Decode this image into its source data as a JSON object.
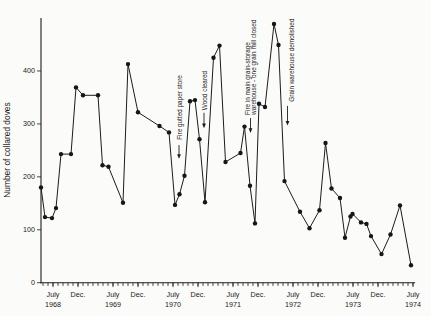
{
  "chart_data": {
    "type": "line",
    "title": "",
    "xlabel": "",
    "ylabel": "Number of collared doves",
    "ylim": [
      0,
      500
    ],
    "yticks": [
      0,
      100,
      200,
      300,
      400
    ],
    "x_unit": "months (Jan 1968 = 0), monthly census points Apr 1968 - Jul 1974",
    "grid": false,
    "legend": false,
    "series_color": "#1c1c1c",
    "xticks": [
      {
        "month": 6,
        "label": "July",
        "year": "1968"
      },
      {
        "month": 11,
        "label": "Dec."
      },
      {
        "month": 18,
        "label": "July",
        "year": "1969"
      },
      {
        "month": 23,
        "label": "Dec."
      },
      {
        "month": 30,
        "label": "July",
        "year": "1970"
      },
      {
        "month": 35,
        "label": "Dec."
      },
      {
        "month": 42,
        "label": "July",
        "year": "1971"
      },
      {
        "month": 47,
        "label": "Dec."
      },
      {
        "month": 54,
        "label": "July",
        "year": "1972"
      },
      {
        "month": 59,
        "label": "Dec."
      },
      {
        "month": 66,
        "label": "July",
        "year": "1973"
      },
      {
        "month": 71,
        "label": "Dec."
      },
      {
        "month": 78,
        "label": "July",
        "year": "1974"
      }
    ],
    "points": [
      [
        3.6,
        180
      ],
      [
        4.4,
        124
      ],
      [
        5.8,
        122
      ],
      [
        6.6,
        141
      ],
      [
        7.6,
        243
      ],
      [
        9.6,
        243
      ],
      [
        10.6,
        369
      ],
      [
        12.0,
        354
      ],
      [
        15.0,
        354
      ],
      [
        15.9,
        222
      ],
      [
        17.1,
        219
      ],
      [
        20.0,
        151
      ],
      [
        21.0,
        413
      ],
      [
        23.0,
        322
      ],
      [
        27.3,
        296
      ],
      [
        29.2,
        284
      ],
      [
        30.4,
        147
      ],
      [
        31.3,
        167
      ],
      [
        32.3,
        202
      ],
      [
        33.4,
        343
      ],
      [
        34.4,
        345
      ],
      [
        35.3,
        271
      ],
      [
        36.4,
        152
      ],
      [
        38.1,
        425
      ],
      [
        39.3,
        448
      ],
      [
        40.5,
        228
      ],
      [
        43.5,
        245
      ],
      [
        44.3,
        295
      ],
      [
        45.4,
        183
      ],
      [
        46.4,
        112
      ],
      [
        47.2,
        338
      ],
      [
        48.4,
        332
      ],
      [
        50.2,
        489
      ],
      [
        51.1,
        449
      ],
      [
        52.3,
        192
      ],
      [
        55.4,
        134
      ],
      [
        57.3,
        103
      ],
      [
        59.3,
        137
      ],
      [
        60.5,
        264
      ],
      [
        61.7,
        178
      ],
      [
        63.4,
        160
      ],
      [
        64.4,
        85
      ],
      [
        65.5,
        125
      ],
      [
        65.9,
        130
      ],
      [
        67.6,
        114
      ],
      [
        68.7,
        111
      ],
      [
        69.6,
        88
      ],
      [
        71.7,
        54
      ],
      [
        73.5,
        91
      ],
      [
        75.4,
        146
      ],
      [
        77.6,
        33
      ]
    ],
    "annotations": [
      {
        "lines": [
          "Fire gutted paper store"
        ],
        "month": 31.2,
        "arrow_month": 31.2,
        "text_base_value": 270,
        "arrow_from_value": 260,
        "arrow_to_value": 234
      },
      {
        "lines": [
          "Wood cleared"
        ],
        "month": 36.2,
        "arrow_month": 36.2,
        "text_base_value": 326,
        "arrow_from_value": 321,
        "arrow_to_value": 292
      },
      {
        "lines": [
          "Fire in main grain-storage",
          "warehouse - one grain mill closed"
        ],
        "month": 45.5,
        "arrow_month": 45.5,
        "text_base_value": 317,
        "arrow_from_value": 311,
        "arrow_to_value": 283
      },
      {
        "lines": [
          "Grain warehouse demolished"
        ],
        "month": 53.6,
        "arrow_month": 52.9,
        "text_base_value": 342,
        "arrow_from_value": 334,
        "arrow_to_value": 297
      }
    ]
  }
}
